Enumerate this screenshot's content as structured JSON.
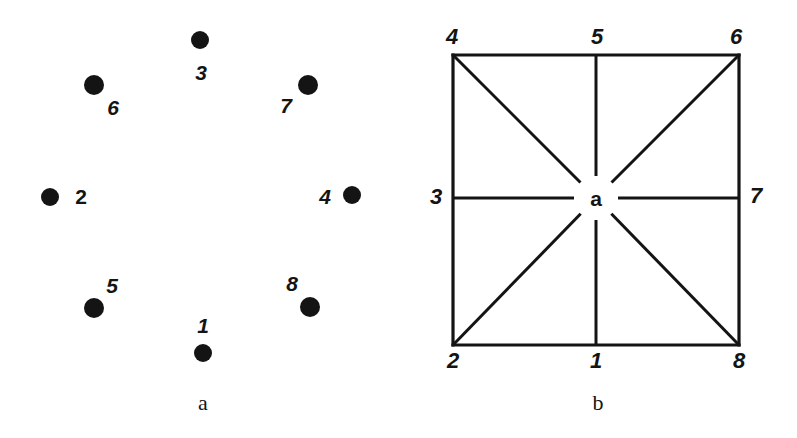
{
  "figure": {
    "background_color": "#ffffff",
    "ink_color": "#141414",
    "width": 797,
    "height": 438
  },
  "chart_data": {
    "type": "scatter",
    "title": "",
    "xlabel": "",
    "ylabel": "",
    "panels": [
      {
        "id": "a",
        "caption": "a",
        "caption_x": 203,
        "caption_y": 403,
        "description": "Eight labelled dots arranged around an empty centre",
        "xlim": [
          0,
          400
        ],
        "ylim": [
          438,
          0
        ],
        "grid": false,
        "marker": "filled-circle",
        "points": [
          {
            "id": "1",
            "label": "1",
            "x": 203,
            "y": 353,
            "r": 9,
            "label_x": 203,
            "label_y": 325
          },
          {
            "id": "2",
            "label": "2",
            "x": 50,
            "y": 197,
            "r": 9,
            "label_x": 81,
            "label_y": 196
          },
          {
            "id": "3",
            "label": "3",
            "x": 200,
            "y": 40,
            "r": 9,
            "label_x": 201,
            "label_y": 72
          },
          {
            "id": "4",
            "label": "4",
            "x": 352,
            "y": 195,
            "r": 9,
            "label_x": 325,
            "label_y": 196
          },
          {
            "id": "5",
            "label": "5",
            "x": 94,
            "y": 308,
            "r": 10,
            "label_x": 112,
            "label_y": 285
          },
          {
            "id": "6",
            "label": "6",
            "x": 94,
            "y": 85,
            "r": 10,
            "label_x": 113,
            "label_y": 107
          },
          {
            "id": "7",
            "label": "7",
            "x": 308,
            "y": 85,
            "r": 10,
            "label_x": 286,
            "label_y": 105
          },
          {
            "id": "8",
            "label": "8",
            "x": 310,
            "y": 307,
            "r": 10,
            "label_x": 292,
            "label_y": 283
          }
        ]
      },
      {
        "id": "b",
        "caption": "b",
        "caption_x": 198,
        "caption_y": 403,
        "description": "Square with the eight boundary nodes joined to a central node a",
        "square": {
          "left": 53,
          "top": 55,
          "right": 339,
          "bottom": 345
        },
        "center": {
          "id": "a",
          "label": "a",
          "x": 196,
          "y": 198
        },
        "nodes": [
          {
            "id": "1",
            "label": "1",
            "x": 196,
            "y": 345,
            "label_x": 196,
            "label_y": 361,
            "position": "bottom-middle"
          },
          {
            "id": "2",
            "label": "2",
            "x": 53,
            "y": 345,
            "label_x": 53,
            "label_y": 361,
            "position": "bottom-left"
          },
          {
            "id": "3",
            "label": "3",
            "x": 53,
            "y": 198,
            "label_x": 36,
            "label_y": 197,
            "position": "middle-left"
          },
          {
            "id": "4",
            "label": "4",
            "x": 53,
            "y": 55,
            "label_x": 52,
            "label_y": 37,
            "position": "top-left"
          },
          {
            "id": "5",
            "label": "5",
            "x": 196,
            "y": 55,
            "label_x": 197,
            "label_y": 37,
            "position": "top-middle"
          },
          {
            "id": "6",
            "label": "6",
            "x": 339,
            "y": 55,
            "label_x": 336,
            "label_y": 37,
            "position": "top-right"
          },
          {
            "id": "7",
            "label": "7",
            "x": 339,
            "y": 198,
            "label_x": 356,
            "label_y": 196,
            "position": "middle-right"
          },
          {
            "id": "8",
            "label": "8",
            "x": 339,
            "y": 345,
            "label_x": 339,
            "label_y": 361,
            "position": "bottom-right"
          }
        ],
        "spokes": [
          {
            "from": "a",
            "to": "1"
          },
          {
            "from": "a",
            "to": "2"
          },
          {
            "from": "a",
            "to": "3"
          },
          {
            "from": "a",
            "to": "4"
          },
          {
            "from": "a",
            "to": "5"
          },
          {
            "from": "a",
            "to": "6"
          },
          {
            "from": "a",
            "to": "7"
          },
          {
            "from": "a",
            "to": "8"
          }
        ],
        "square_edges": [
          {
            "from": "4",
            "to": "6",
            "side": "top"
          },
          {
            "from": "6",
            "to": "8",
            "side": "right"
          },
          {
            "from": "8",
            "to": "2",
            "side": "bottom"
          },
          {
            "from": "2",
            "to": "4",
            "side": "left"
          }
        ]
      }
    ]
  }
}
